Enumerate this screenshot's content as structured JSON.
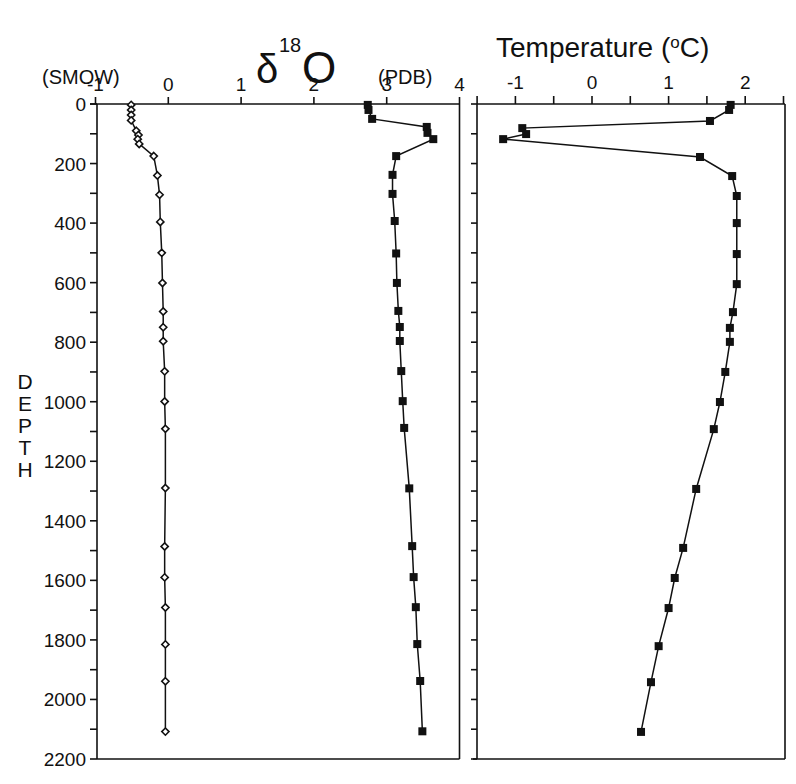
{
  "chart_data": [
    {
      "type": "line",
      "panel": "left",
      "title": "δ18O",
      "title_prefix": "δ",
      "title_sup": "18",
      "title_main": "O",
      "subtitle_left": "(SMOW)",
      "subtitle_right": "(PDB)",
      "xlabel": "δ18O",
      "ylabel": "DEPTH",
      "xlim": [
        -1,
        4
      ],
      "ylim": [
        2200,
        0
      ],
      "x_ticks": [
        -1,
        0,
        1,
        2,
        3,
        4
      ],
      "x_tick_labels": [
        "-1",
        "0",
        "1",
        "2",
        "3",
        "4"
      ],
      "y_ticks": [
        0,
        200,
        400,
        600,
        800,
        1000,
        1200,
        1400,
        1600,
        1800,
        2000,
        2200
      ],
      "y_tick_labels": [
        "0",
        "200",
        "400",
        "600",
        "800",
        "1000",
        "1200",
        "1400",
        "1600",
        "1800",
        "2000",
        "2200"
      ],
      "grid": false,
      "series": [
        {
          "name": "SMOW",
          "marker": "open-diamond",
          "points": [
            {
              "depth": 3,
              "value": -0.51
            },
            {
              "depth": 20,
              "value": -0.51
            },
            {
              "depth": 37,
              "value": -0.51
            },
            {
              "depth": 55,
              "value": -0.51
            },
            {
              "depth": 90,
              "value": -0.44
            },
            {
              "depth": 104,
              "value": -0.41
            },
            {
              "depth": 118,
              "value": -0.42
            },
            {
              "depth": 134,
              "value": -0.4
            },
            {
              "depth": 175,
              "value": -0.2
            },
            {
              "depth": 240,
              "value": -0.15
            },
            {
              "depth": 305,
              "value": -0.12
            },
            {
              "depth": 396,
              "value": -0.11
            },
            {
              "depth": 500,
              "value": -0.09
            },
            {
              "depth": 601,
              "value": -0.08
            },
            {
              "depth": 697,
              "value": -0.07
            },
            {
              "depth": 750,
              "value": -0.07
            },
            {
              "depth": 797,
              "value": -0.07
            },
            {
              "depth": 898,
              "value": -0.05
            },
            {
              "depth": 999,
              "value": -0.05
            },
            {
              "depth": 1091,
              "value": -0.04
            },
            {
              "depth": 1290,
              "value": -0.04
            },
            {
              "depth": 1486,
              "value": -0.05
            },
            {
              "depth": 1590,
              "value": -0.05
            },
            {
              "depth": 1691,
              "value": -0.04
            },
            {
              "depth": 1815,
              "value": -0.04
            },
            {
              "depth": 1939,
              "value": -0.04
            },
            {
              "depth": 2108,
              "value": -0.04
            }
          ]
        },
        {
          "name": "PDB",
          "marker": "filled-square",
          "points": [
            {
              "depth": 3,
              "value": 2.74
            },
            {
              "depth": 20,
              "value": 2.75
            },
            {
              "depth": 50,
              "value": 2.8
            },
            {
              "depth": 77,
              "value": 3.55
            },
            {
              "depth": 97,
              "value": 3.56
            },
            {
              "depth": 118,
              "value": 3.64
            },
            {
              "depth": 175,
              "value": 3.13
            },
            {
              "depth": 238,
              "value": 3.08
            },
            {
              "depth": 302,
              "value": 3.08
            },
            {
              "depth": 393,
              "value": 3.11
            },
            {
              "depth": 502,
              "value": 3.13
            },
            {
              "depth": 601,
              "value": 3.14
            },
            {
              "depth": 695,
              "value": 3.16
            },
            {
              "depth": 749,
              "value": 3.18
            },
            {
              "depth": 796,
              "value": 3.18
            },
            {
              "depth": 897,
              "value": 3.2
            },
            {
              "depth": 998,
              "value": 3.22
            },
            {
              "depth": 1088,
              "value": 3.24
            },
            {
              "depth": 1291,
              "value": 3.31
            },
            {
              "depth": 1485,
              "value": 3.35
            },
            {
              "depth": 1589,
              "value": 3.37
            },
            {
              "depth": 1690,
              "value": 3.4
            },
            {
              "depth": 1814,
              "value": 3.42
            },
            {
              "depth": 1938,
              "value": 3.46
            },
            {
              "depth": 2107,
              "value": 3.49
            }
          ]
        }
      ]
    },
    {
      "type": "line",
      "panel": "right",
      "title": "Temperature (ºC)",
      "title_main": "Temperature (",
      "title_sup": "o",
      "title_end": "C)",
      "xlabel": "Temperature (ºC)",
      "ylabel": "DEPTH",
      "xlim": [
        -1.5,
        2.5
      ],
      "ylim": [
        2200,
        0
      ],
      "x_ticks": [
        -1,
        0,
        1,
        2
      ],
      "x_tick_labels": [
        "-1",
        "0",
        "1",
        "2"
      ],
      "x_minor_ticks": [
        -1.5,
        -0.5,
        0.5,
        1.5,
        2.5
      ],
      "grid": false,
      "series": [
        {
          "name": "Temperature",
          "marker": "filled-square",
          "points": [
            {
              "depth": 3,
              "value": 1.81
            },
            {
              "depth": 20,
              "value": 1.79
            },
            {
              "depth": 57,
              "value": 1.54
            },
            {
              "depth": 81,
              "value": -0.91
            },
            {
              "depth": 101,
              "value": -0.86
            },
            {
              "depth": 118,
              "value": -1.16
            },
            {
              "depth": 178,
              "value": 1.41
            },
            {
              "depth": 242,
              "value": 1.83
            },
            {
              "depth": 309,
              "value": 1.89
            },
            {
              "depth": 400,
              "value": 1.89
            },
            {
              "depth": 504,
              "value": 1.89
            },
            {
              "depth": 605,
              "value": 1.89
            },
            {
              "depth": 699,
              "value": 1.84
            },
            {
              "depth": 752,
              "value": 1.8
            },
            {
              "depth": 799,
              "value": 1.8
            },
            {
              "depth": 900,
              "value": 1.74
            },
            {
              "depth": 1001,
              "value": 1.67
            },
            {
              "depth": 1092,
              "value": 1.59
            },
            {
              "depth": 1293,
              "value": 1.36
            },
            {
              "depth": 1491,
              "value": 1.19
            },
            {
              "depth": 1592,
              "value": 1.08
            },
            {
              "depth": 1693,
              "value": 1.0
            },
            {
              "depth": 1821,
              "value": 0.87
            },
            {
              "depth": 1942,
              "value": 0.77
            },
            {
              "depth": 2109,
              "value": 0.64
            }
          ]
        }
      ]
    }
  ],
  "depth_axis_label": [
    "D",
    "E",
    "P",
    "T",
    "H"
  ]
}
